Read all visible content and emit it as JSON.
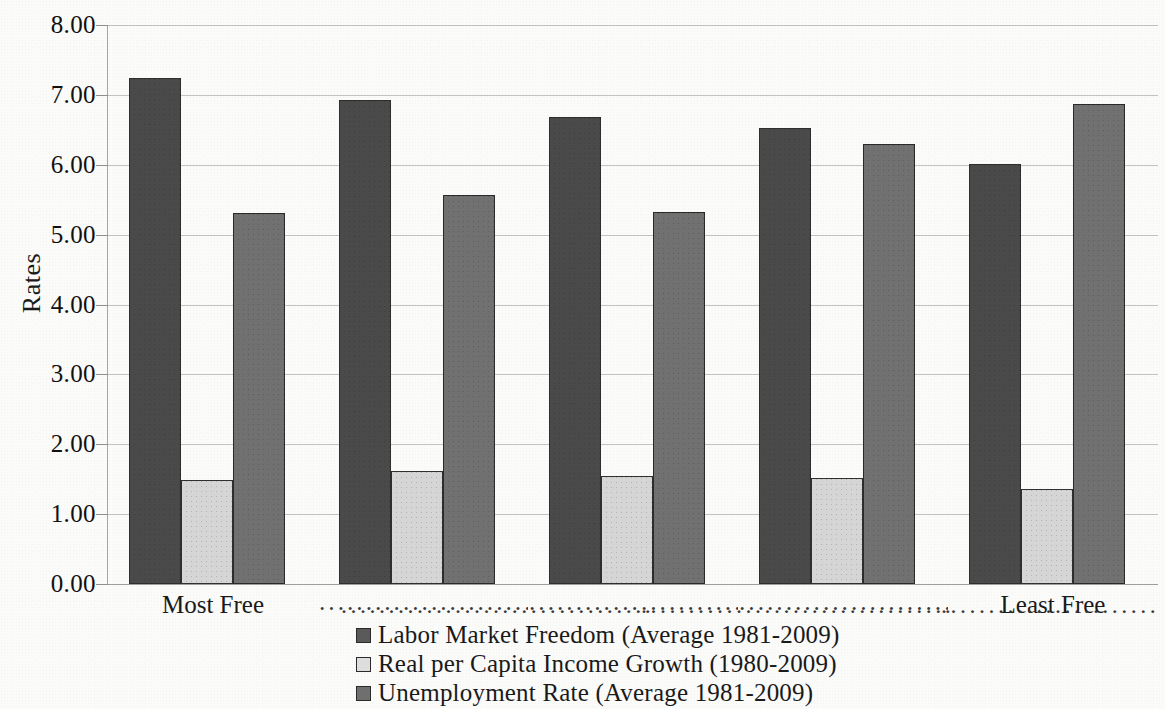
{
  "chart_data": {
    "type": "bar",
    "title": "",
    "xlabel": "",
    "ylabel": "Rates",
    "ylim": [
      0,
      8
    ],
    "ytick_step": 1,
    "grid": true,
    "legend_position": "bottom",
    "categories": [
      "Most Free",
      "······",
      "······",
      "······",
      "Least Free"
    ],
    "category_labels": [
      "Most Free",
      "",
      "",
      "",
      "Least Free"
    ],
    "ytick_labels": [
      "8.00",
      "7.00",
      "6.00",
      "5.00",
      "4.00",
      "3.00",
      "2.00",
      "1.00",
      "0.00"
    ],
    "ytick_values": [
      8,
      7,
      6,
      5,
      4,
      3,
      2,
      1,
      0
    ],
    "series": [
      {
        "name": "Labor Market Freedom (Average 1981-2009)",
        "color": "#4a4a4a",
        "values": [
          7.24,
          6.92,
          6.68,
          6.52,
          6.01
        ]
      },
      {
        "name": "Real per Capita Income Growth (1980-2009)",
        "color": "#d6d6d6",
        "values": [
          1.49,
          1.62,
          1.54,
          1.52,
          1.36
        ]
      },
      {
        "name": "Unemployment Rate (Average 1981-2009)",
        "color": "#717171",
        "values": [
          5.31,
          5.57,
          5.32,
          6.3,
          6.87
        ]
      }
    ]
  },
  "axis": {
    "y_title": "Rates"
  },
  "legend": {
    "items": [
      {
        "label": "Labor Market Freedom (Average 1981-2009)",
        "swatch": "s0"
      },
      {
        "label": "Real per Capita Income Growth (1980-2009)",
        "swatch": "s1"
      },
      {
        "label": "Unemployment Rate (Average 1981-2009)",
        "swatch": "s2"
      }
    ]
  },
  "xaxis": {
    "labels": [
      "Most Free",
      "Least Free"
    ],
    "dot_leader": "·································"
  }
}
